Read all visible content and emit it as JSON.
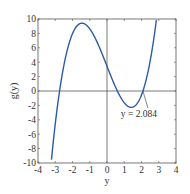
{
  "chart_data": {
    "type": "line",
    "title": "",
    "xlabel": "y",
    "ylabel": "g(y)",
    "xlim": [
      -4,
      4
    ],
    "ylim": [
      -10,
      10
    ],
    "xticks": [
      -4,
      -3,
      -2,
      -1,
      0,
      1,
      2,
      3,
      4
    ],
    "yticks": [
      -10,
      -8,
      -6,
      -4,
      -2,
      0,
      2,
      4,
      6,
      8,
      10
    ],
    "xtick_labels": [
      "-4",
      "-3",
      "-2",
      "-1",
      "0",
      "1",
      "2",
      "3",
      "4"
    ],
    "ytick_labels": [
      "-10",
      "-8",
      "-6",
      "-4",
      "-2",
      "0",
      "2",
      "4",
      "6",
      "8",
      "10"
    ],
    "grid": false,
    "reference_lines": {
      "x0": true,
      "y0": true
    },
    "series": [
      {
        "name": "g(y)",
        "color": "#2a5ca8",
        "description": "cubic approx (y+2.75)(y-0.6)(y-2.084)",
        "x": [
          -3.2,
          -3.0,
          -2.75,
          -2.5,
          -2.0,
          -1.5,
          -1.4,
          -1.0,
          -0.5,
          0.0,
          0.6,
          1.0,
          1.4,
          1.8,
          2.084,
          2.5,
          2.9
        ],
        "y": [
          -10.3,
          -5.6,
          0.0,
          4.4,
          8.1,
          9.4,
          9.4,
          8.9,
          7.0,
          3.4,
          0.0,
          -1.4,
          -2.3,
          -1.7,
          0.0,
          4.1,
          10.0
        ]
      }
    ],
    "annotations": [
      {
        "text": "y = 2.084",
        "x": 2.084,
        "y": 0
      }
    ]
  },
  "labels": {
    "xlabel": "y",
    "ylabel": "g(y)",
    "annotation": "y = 2.084"
  }
}
